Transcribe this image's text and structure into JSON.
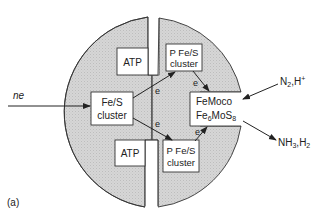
{
  "figure_label": "(a)",
  "colors": {
    "protein_fill": "#d4d4d4",
    "outline": "#333333",
    "text": "#222222",
    "background": "#ffffff"
  },
  "input_label": "ne",
  "electron_label": "e",
  "left_half": {
    "atp_top": "ATP",
    "atp_bottom": "ATP",
    "fes_cluster": [
      "Fe/S",
      "cluster"
    ]
  },
  "right_half": {
    "p_cluster_top": [
      "P Fe/S",
      "cluster"
    ],
    "p_cluster_bottom": [
      "P Fe/S",
      "cluster"
    ],
    "femoco": {
      "line1": "FeMoco",
      "line2_base": "Fe",
      "line2_sub1": "6",
      "line2_mid": "MoS",
      "line2_sub2": "8"
    }
  },
  "substrates": {
    "base1": "N",
    "sub1": "2",
    "rest": ",H",
    "sup": "+"
  },
  "products": {
    "base1": "NH",
    "sub1": "3",
    "mid": ",H",
    "sub2": "2"
  }
}
